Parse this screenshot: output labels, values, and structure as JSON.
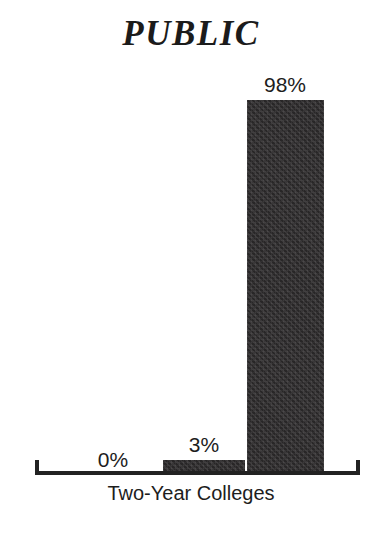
{
  "chart_data": {
    "type": "bar",
    "title": "PUBLIC",
    "xlabel": "Two-Year Colleges",
    "ylabel": "",
    "categories": [
      "",
      "",
      ""
    ],
    "values": [
      0,
      3,
      98
    ],
    "value_labels": [
      "0%",
      "3%",
      "98%"
    ],
    "ylim": [
      0,
      100
    ],
    "grid": false,
    "legend": null,
    "colors": {
      "bar_fill": "#333132",
      "axis": "#222222",
      "text": "#1d1d1d",
      "background": "#ffffff"
    },
    "axis": {
      "x_label": "Two-Year Colleges",
      "has_end_caps": true,
      "tick_labels": []
    }
  },
  "figure": {
    "title": "PUBLIC",
    "x_axis_label": "Two-Year Colleges",
    "bars": [
      {
        "value_label": "0%",
        "value": 0
      },
      {
        "value_label": "3%",
        "value": 3
      },
      {
        "value_label": "98%",
        "value": 98
      }
    ]
  }
}
